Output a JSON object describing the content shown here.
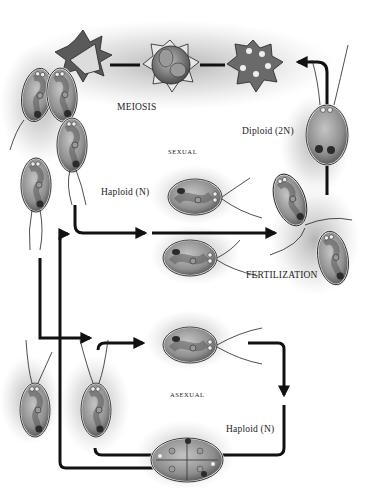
{
  "labels": {
    "meiosis": "MEIOSIS",
    "sexual": "SEXUAL",
    "diploid": "Diploid (2N)",
    "haploid_sexual": "Haploid (N)",
    "fertilization": "FERTILIZATION",
    "asexual": "ASEXUAL",
    "haploid_asexual": "Haploid (N)"
  },
  "cycles": [
    {
      "name": "sexual",
      "stages": [
        "Haploid (N) gametes",
        "FERTILIZATION",
        "Diploid (2N) zygote",
        "zygospore",
        "MEIOSIS",
        "haploid cells released"
      ]
    },
    {
      "name": "asexual",
      "stages": [
        "Haploid (N) cell",
        "mitotic division in sporangium",
        "daughter cells released"
      ]
    }
  ],
  "colors": {
    "ink": "#1a1a1a",
    "cell_fill": "#a9a9a9",
    "cell_dark": "#6e6e6e",
    "stipple": "#555555",
    "background": "#ffffff"
  }
}
